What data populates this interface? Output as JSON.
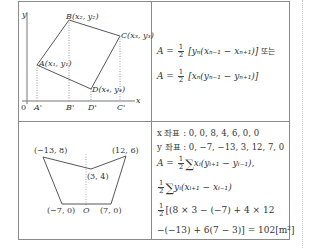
{
  "top_left_diagram": {
    "axis_labels": {
      "y": "y",
      "x": "x",
      "origin": "0"
    },
    "points": {
      "A": "A(x₁, y₁)",
      "B": "B(x₂, y₂)",
      "C": "C(x₃, y₃)",
      "D": "D(x₄, y₄)"
    },
    "projections": [
      "A'",
      "B'",
      "D'",
      "C'"
    ]
  },
  "top_right_formulas": {
    "line1": {
      "lhs": "A =",
      "num": "1",
      "den": "2",
      "body": "[yₙ(xₙ₋₁ − xₙ₊₁)]",
      "suffix": "또는"
    },
    "line2": {
      "lhs": "A =",
      "num": "1",
      "den": "2",
      "body": "[xₙ(yₙ₋₁ − yₙ₊₁)]"
    }
  },
  "bottom_left_diagram": {
    "vertices": [
      {
        "label": "(−13, 8)",
        "x": -13,
        "y": 8
      },
      {
        "label": "(3, 4)",
        "x": 3,
        "y": 4
      },
      {
        "label": "(12, 6)",
        "x": 12,
        "y": 6
      },
      {
        "label": "(7, 0)",
        "x": 7,
        "y": 0
      },
      {
        "label": "(−7, 0)",
        "x": -7,
        "y": 0
      }
    ],
    "origin_label": "O"
  },
  "bottom_right_calc": {
    "x_coords": "x 좌표 : 0,  0,  8,  4,  6,  0,  0",
    "y_coords": "y 좌표 : 0,  −7,  −13,  3,  12,  7,  0",
    "line3": {
      "lhs": "A =",
      "num": "1",
      "den": "2",
      "body": "xᵢ(yᵢ₊₁ − yᵢ₋₁),"
    },
    "line4": {
      "num": "1",
      "den": "2",
      "body": "yᵢ(xᵢ₊₁ − xᵢ₋₁)"
    },
    "line5": {
      "num": "1",
      "den": "2",
      "body": "[(8 × 3 − (−7) + 4 × 12"
    },
    "line6": "−(−13) + 6(7 − 3)] = 102[m²]",
    "sigma": "∑"
  }
}
